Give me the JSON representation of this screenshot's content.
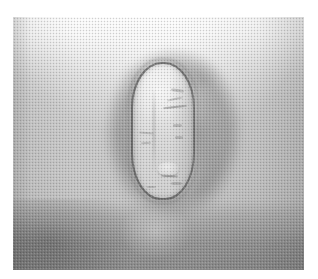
{
  "page": {
    "kind": "photograph",
    "subject_description": "Grayscale clinical close-up photograph of skin showing a single ovoid lesion",
    "rendering": "halftone print, monochrome",
    "width_px": 318,
    "height_px": 279,
    "caption_text": ""
  },
  "photo": {
    "region": {
      "x": 13,
      "y": 17,
      "width": 291,
      "height": 253
    },
    "background": {
      "name": "skin-surface",
      "tone_top_hex": "#fdfdfd",
      "tone_mid_hex": "#bebebe",
      "tone_bottom_hex": "#8e8e8e",
      "highlight_position": "top-center",
      "shadow_position": "bottom-left"
    },
    "halo": {
      "name": "perilesional-shadow",
      "tone_hex": "#3c3c3c",
      "strongest_side": "right"
    },
    "lesion": {
      "name": "ovoid-lesion",
      "shape": "vertical oval",
      "bounds": {
        "x": 131,
        "y": 62,
        "width": 64,
        "height": 138
      },
      "rim_tone_hex": "#484848",
      "interior_tone_hex": "#e2e2e2",
      "interior_features": [
        "vertical central crease",
        "short dark horizontal streak upper-right",
        "small pale nodule lower-center",
        "scattered dark specks"
      ]
    }
  },
  "texture": {
    "name": "halftone-dither",
    "dot_pitch_px": 2,
    "dark_dot_hex": "#282828",
    "light_dot_hex": "#ffffff"
  },
  "margins": {
    "color_hex": "#ffffff",
    "top_px": 17,
    "left_px": 13,
    "right_px": 14,
    "bottom_px": 9
  }
}
